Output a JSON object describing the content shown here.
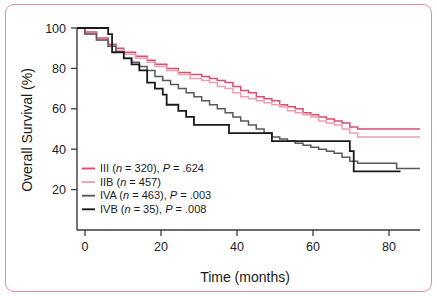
{
  "figure": {
    "border_color": "#e8899e",
    "background": "#ffffff"
  },
  "chart_data": {
    "type": "line",
    "title": "",
    "subtitle": "",
    "xlabel": "Time (months)",
    "ylabel": "Overall Survival (%)",
    "xlim": [
      0,
      88
    ],
    "ylim": [
      0,
      105
    ],
    "xticks": [
      0,
      20,
      40,
      60,
      80
    ],
    "xtick_labels": [
      "0",
      "20",
      "40",
      "60",
      "80"
    ],
    "yticks": [
      20,
      40,
      60,
      80,
      100
    ],
    "ytick_labels": [
      "20",
      "40",
      "60",
      "80",
      "100"
    ],
    "grid": false,
    "legend_position": "lower-left-inside",
    "step_type": "post",
    "series": [
      {
        "name": "III",
        "label": "III (n = 320), P = .624",
        "group": "III",
        "n": 320,
        "p_value": ".624",
        "color": "#e04a72",
        "x": [
          0,
          2,
          5,
          8,
          10,
          12,
          15,
          18,
          20,
          23,
          26,
          29,
          32,
          34,
          36,
          38,
          40,
          42,
          44,
          46,
          48,
          50,
          52,
          54,
          56,
          58,
          60,
          62,
          64,
          66,
          68,
          70,
          72,
          74,
          78,
          82,
          88
        ],
        "y": [
          100,
          98,
          95,
          92,
          90,
          88,
          86,
          84,
          82,
          80,
          78,
          77,
          76,
          75,
          74,
          73,
          71,
          69,
          68,
          66,
          65,
          64,
          62,
          61,
          60,
          58,
          57,
          56,
          55,
          54,
          53,
          51,
          50,
          50,
          50,
          50,
          50
        ]
      },
      {
        "name": "IIB",
        "label": "IIB (n = 457)",
        "group": "IIB",
        "n": 457,
        "p_value": "",
        "color": "#ef9eb0",
        "x": [
          0,
          2,
          5,
          8,
          10,
          12,
          15,
          18,
          20,
          23,
          26,
          29,
          32,
          34,
          36,
          38,
          40,
          42,
          44,
          46,
          48,
          50,
          52,
          54,
          56,
          58,
          60,
          62,
          64,
          66,
          68,
          70,
          72,
          74,
          78,
          82,
          88
        ],
        "y": [
          100,
          97,
          94,
          91,
          89,
          87,
          85,
          83,
          81,
          79,
          77,
          75,
          74,
          73,
          71,
          70,
          68,
          66,
          65,
          64,
          63,
          62,
          61,
          59,
          58,
          57,
          56,
          54,
          53,
          52,
          50,
          48,
          46,
          46,
          46,
          46,
          46
        ]
      },
      {
        "name": "IVA",
        "label": "IVA (n = 463), P = .003",
        "group": "IVA",
        "n": 463,
        "p_value": ".003",
        "color": "#58595b",
        "x": [
          0,
          2,
          5,
          8,
          10,
          12,
          14,
          16,
          18,
          20,
          22,
          24,
          26,
          28,
          30,
          32,
          34,
          36,
          38,
          40,
          42,
          44,
          46,
          48,
          50,
          52,
          54,
          56,
          58,
          60,
          62,
          64,
          66,
          68,
          70,
          72,
          74,
          78,
          82,
          88
        ],
        "y": [
          100,
          97,
          94,
          91,
          88,
          85,
          83,
          81,
          79,
          76,
          74,
          72,
          70,
          68,
          66,
          64,
          62,
          60,
          58,
          56,
          54,
          52,
          50,
          48,
          46,
          45,
          44,
          43,
          42,
          41,
          40,
          39,
          38,
          36,
          34,
          33,
          33,
          33,
          30.5,
          30.5
        ]
      },
      {
        "name": "IVB",
        "label": "IVB (n = 35), P = .008",
        "group": "IVB",
        "n": 35,
        "p_value": ".008",
        "color": "#1a1a1a",
        "x": [
          0,
          8,
          9,
          12,
          14,
          16,
          18,
          20,
          22,
          23,
          26,
          28,
          30,
          33,
          39,
          44,
          50,
          56,
          62,
          66,
          70,
          71,
          76,
          83
        ],
        "y": [
          100,
          97,
          88,
          85,
          82,
          79,
          73,
          70,
          67,
          62,
          59,
          56,
          52,
          52,
          48,
          48,
          44,
          44,
          44,
          44,
          39,
          29,
          29,
          29
        ]
      }
    ]
  },
  "axes": {
    "y_title": "Overall Survival (%)",
    "x_title": "Time (months)"
  },
  "legend": {
    "entries": [
      {
        "swatch_color": "#e04a72",
        "group": "III",
        "n_prefix": "(",
        "n_italic": "n",
        "n_value": " = 320), ",
        "p_italic": "P",
        "p_value": " = .624"
      },
      {
        "swatch_color": "#ef9eb0",
        "group": "IIB",
        "n_prefix": "(",
        "n_italic": "n",
        "n_value": " = 457)",
        "p_italic": "",
        "p_value": ""
      },
      {
        "swatch_color": "#58595b",
        "group": "IVA",
        "n_prefix": "(",
        "n_italic": "n",
        "n_value": " = 463), ",
        "p_italic": "P",
        "p_value": " = .003"
      },
      {
        "swatch_color": "#1a1a1a",
        "group": "IVB",
        "n_prefix": "(",
        "n_italic": "n",
        "n_value": " = 35), ",
        "p_italic": "P",
        "p_value": " = .008"
      }
    ]
  }
}
